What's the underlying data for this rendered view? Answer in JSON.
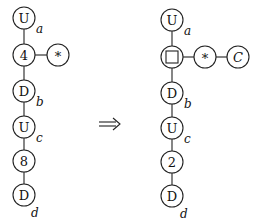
{
  "diagram": {
    "arrow_symbol": "⟹",
    "left": {
      "nodes": [
        {
          "id": "L1",
          "label": "U",
          "subscript": "a",
          "x": 24,
          "y": 18
        },
        {
          "id": "L2",
          "label": "4",
          "subscript": "",
          "x": 24,
          "y": 55
        },
        {
          "id": "L3",
          "label": "*",
          "subscript": "",
          "x": 58,
          "y": 55
        },
        {
          "id": "L4",
          "label": "D",
          "subscript": "b",
          "x": 24,
          "y": 91
        },
        {
          "id": "L5",
          "label": "U",
          "subscript": "c",
          "x": 24,
          "y": 127
        },
        {
          "id": "L6",
          "label": "8",
          "subscript": "",
          "x": 24,
          "y": 161
        },
        {
          "id": "L7",
          "label": "D",
          "subscript": "d",
          "x": 24,
          "y": 195
        }
      ],
      "edges": [
        [
          "L1",
          "L2"
        ],
        [
          "L2",
          "L3"
        ],
        [
          "L2",
          "L4"
        ],
        [
          "L4",
          "L5"
        ],
        [
          "L5",
          "L6"
        ],
        [
          "L6",
          "L7"
        ]
      ]
    },
    "right": {
      "nodes": [
        {
          "id": "R1",
          "label": "U",
          "subscript": "a",
          "x": 172,
          "y": 20
        },
        {
          "id": "R2",
          "label": "□",
          "subscript": "",
          "x": 172,
          "y": 57
        },
        {
          "id": "R3",
          "label": "*",
          "subscript": "",
          "x": 205,
          "y": 57
        },
        {
          "id": "R4",
          "label": "C",
          "subscript": "",
          "x": 238,
          "y": 57
        },
        {
          "id": "R5",
          "label": "D",
          "subscript": "b",
          "x": 172,
          "y": 93
        },
        {
          "id": "R6",
          "label": "U",
          "subscript": "c",
          "x": 172,
          "y": 128
        },
        {
          "id": "R7",
          "label": "2",
          "subscript": "",
          "x": 172,
          "y": 162
        },
        {
          "id": "R8",
          "label": "D",
          "subscript": "d",
          "x": 172,
          "y": 196
        }
      ],
      "edges": [
        [
          "R1",
          "R2"
        ],
        [
          "R2",
          "R3"
        ],
        [
          "R3",
          "R4"
        ],
        [
          "R2",
          "R5"
        ],
        [
          "R5",
          "R6"
        ],
        [
          "R6",
          "R7"
        ],
        [
          "R7",
          "R8"
        ]
      ]
    }
  }
}
